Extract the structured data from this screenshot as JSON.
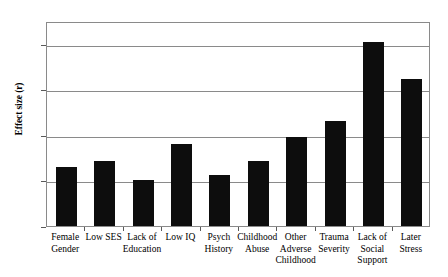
{
  "chart_data": {
    "type": "bar",
    "title": "",
    "xlabel": "",
    "ylabel": "Effect size (r)",
    "ylim": [
      0,
      0.45
    ],
    "yticks": [
      "0",
      "0.1",
      "0.2",
      "0.3",
      "0.4"
    ],
    "ytick_values": [
      0,
      0.1,
      0.2,
      0.3,
      0.4
    ],
    "grid": true,
    "legend": "none",
    "bar_color": "#0d0d0d",
    "grid_color": "#8a8a8a",
    "background_color": "#ffffff",
    "categories": [
      "Female\nGender",
      "Low SES",
      "Lack of\nEducation",
      "Low IQ",
      "Psych\nHistory",
      "Childhood\nAbuse",
      "Other\nAdverse\nChildhood",
      "Trauma\nSeverity",
      "Lack of\nSocial\nSupport",
      "Later\nStress"
    ],
    "values": [
      0.13,
      0.142,
      0.1,
      0.18,
      0.112,
      0.142,
      0.195,
      0.23,
      0.405,
      0.322
    ]
  }
}
